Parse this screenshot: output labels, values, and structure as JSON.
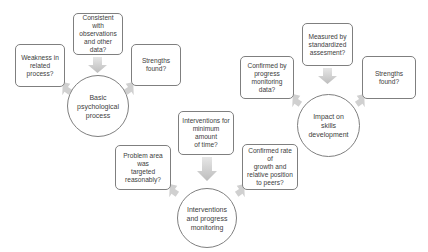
{
  "colors": {
    "border": "#7f7f7f",
    "arrow": "#c8c8c8",
    "text": "#404040",
    "background": "#ffffff"
  },
  "clusters": [
    {
      "center": {
        "label": "Basic\npsychological\nprocess"
      },
      "top": {
        "label": "Consistent with\nobservations\nand other data?"
      },
      "left": {
        "label": "Weakness in\nrelated\nprocess?"
      },
      "right": {
        "label": "Strengths\nfound?"
      }
    },
    {
      "center": {
        "label": "Impact on\nskills\ndevelopment"
      },
      "top": {
        "label": "Measured by\nstandardized\nassesment?"
      },
      "left": {
        "label": "Confirmed by\nprogress\nmonitoring data?"
      },
      "right": {
        "label": "Strengths found?"
      }
    },
    {
      "center": {
        "label": "Interventions\nand progress\nmonitoring"
      },
      "top": {
        "label": "Interventions for\nminimum amount\nof time?"
      },
      "left": {
        "label": "Problem area was\ntargeted\nreasonably?"
      },
      "right": {
        "label": "Confirmed rate of\ngrowth and\nrelative position\nto peers?"
      }
    }
  ]
}
